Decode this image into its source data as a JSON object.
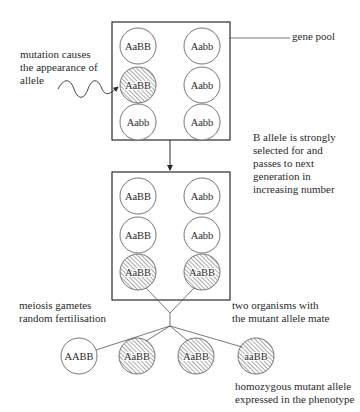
{
  "diagram": {
    "title": "",
    "labels": {
      "mutation": [
        "mutation causes",
        "the appearance of",
        "allele"
      ],
      "gene_pool": "gene pool",
      "selection": [
        "B allele is strongly",
        "selected for and",
        "passes to next",
        "generation in",
        "increasing number"
      ],
      "meiosis": [
        "meiosis gametes",
        "random fertilisation"
      ],
      "mating": [
        "two organisms with",
        "the mutant allele mate"
      ],
      "homozygous": [
        "homozygous mutant allele",
        "expressed in the phenotype"
      ]
    },
    "gene_pool_1": {
      "organisms": [
        {
          "genotype": "AaBB",
          "mutant": false
        },
        {
          "genotype": "Aabb",
          "mutant": false
        },
        {
          "genotype": "AaBB",
          "mutant": true
        },
        {
          "genotype": "Aabb",
          "mutant": false
        },
        {
          "genotype": "Aabb",
          "mutant": false
        },
        {
          "genotype": "Aabb",
          "mutant": false
        }
      ]
    },
    "gene_pool_2": {
      "organisms": [
        {
          "genotype": "AaBB",
          "mutant": false
        },
        {
          "genotype": "Aabb",
          "mutant": false
        },
        {
          "genotype": "AaBB",
          "mutant": false
        },
        {
          "genotype": "Aabb",
          "mutant": false
        },
        {
          "genotype": "AaBB",
          "mutant": true
        },
        {
          "genotype": "AaBB",
          "mutant": true
        }
      ]
    },
    "offspring": [
      {
        "genotype": "AABB",
        "mutant": false
      },
      {
        "genotype": "AaBB",
        "mutant": true
      },
      {
        "genotype": "AaBB",
        "mutant": true
      },
      {
        "genotype": "aaBB",
        "mutant": true
      }
    ],
    "colors": {
      "line": "#2a2a2a",
      "hatch": "#555555",
      "background": "#ffffff"
    }
  }
}
